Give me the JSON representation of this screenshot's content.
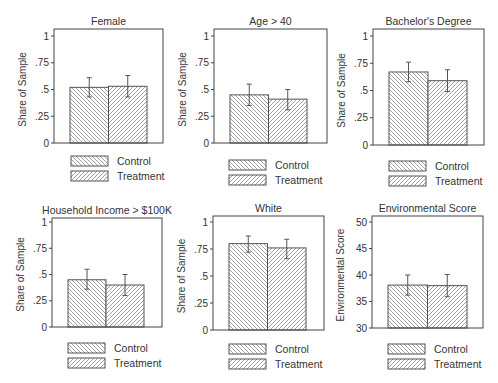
{
  "figure": {
    "legend": {
      "items": [
        {
          "label": "Control",
          "pattern": "hatch-back"
        },
        {
          "label": "Treatment",
          "pattern": "hatch-forward"
        }
      ]
    },
    "colors": {
      "frame": "#444444",
      "bar_fill": "#ffffff",
      "hatch": "#8a8a8a",
      "bar_edge": "#555555",
      "error_bar": "#555555",
      "text": "#333333"
    }
  },
  "chart_data": [
    {
      "type": "bar",
      "title": "Female",
      "xlabel": "",
      "ylabel": "Share of Sample",
      "ylim": [
        0,
        1
      ],
      "yticks": [
        "0",
        ".25",
        ".5",
        ".75",
        "1"
      ],
      "ytick_values": [
        0,
        0.25,
        0.5,
        0.75,
        1
      ],
      "categories": [
        "Control",
        "Treatment"
      ],
      "values": [
        0.52,
        0.53
      ],
      "error_low": [
        0.43,
        0.43
      ],
      "error_high": [
        0.61,
        0.63
      ],
      "grid": false,
      "legend_position": "below"
    },
    {
      "type": "bar",
      "title": "Age > 40",
      "xlabel": "",
      "ylabel": "Share of Sample",
      "ylim": [
        0,
        1
      ],
      "yticks": [
        "0",
        ".25",
        ".5",
        ".75",
        "1"
      ],
      "ytick_values": [
        0,
        0.25,
        0.5,
        0.75,
        1
      ],
      "categories": [
        "Control",
        "Treatment"
      ],
      "values": [
        0.45,
        0.41
      ],
      "error_low": [
        0.35,
        0.31
      ],
      "error_high": [
        0.55,
        0.5
      ],
      "grid": false,
      "legend_position": "below"
    },
    {
      "type": "bar",
      "title": "Bachelor's Degree",
      "xlabel": "",
      "ylabel": "Share of Sample",
      "ylim": [
        0,
        1
      ],
      "yticks": [
        "0",
        ".25",
        ".5",
        ".75",
        "1"
      ],
      "ytick_values": [
        0,
        0.25,
        0.5,
        0.75,
        1
      ],
      "categories": [
        "Control",
        "Treatment"
      ],
      "values": [
        0.67,
        0.59
      ],
      "error_low": [
        0.58,
        0.49
      ],
      "error_high": [
        0.76,
        0.69
      ],
      "grid": false,
      "legend_position": "below"
    },
    {
      "type": "bar",
      "title": "Household Income > $100K",
      "xlabel": "",
      "ylabel": "Share of Sample",
      "ylim": [
        0,
        1
      ],
      "yticks": [
        "0",
        ".25",
        ".5",
        ".75",
        "1"
      ],
      "ytick_values": [
        0,
        0.25,
        0.5,
        0.75,
        1
      ],
      "categories": [
        "Control",
        "Treatment"
      ],
      "values": [
        0.45,
        0.4
      ],
      "error_low": [
        0.36,
        0.3
      ],
      "error_high": [
        0.55,
        0.5
      ],
      "grid": false,
      "legend_position": "below"
    },
    {
      "type": "bar",
      "title": "White",
      "xlabel": "",
      "ylabel": "Share of Sample",
      "ylim": [
        0,
        1
      ],
      "yticks": [
        "0",
        ".25",
        ".5",
        ".75",
        "1"
      ],
      "ytick_values": [
        0,
        0.25,
        0.5,
        0.75,
        1
      ],
      "categories": [
        "Control",
        "Treatment"
      ],
      "values": [
        0.8,
        0.76
      ],
      "error_low": [
        0.72,
        0.66
      ],
      "error_high": [
        0.87,
        0.84
      ],
      "grid": false,
      "legend_position": "below"
    },
    {
      "type": "bar",
      "title": "Environmental Score",
      "xlabel": "",
      "ylabel": "Environmental Score",
      "ylim": [
        30,
        50
      ],
      "yticks": [
        "30",
        "35",
        "40",
        "45",
        "50"
      ],
      "ytick_values": [
        30,
        35,
        40,
        45,
        50
      ],
      "categories": [
        "Control",
        "Treatment"
      ],
      "values": [
        38.1,
        38.0
      ],
      "error_low": [
        36.2,
        35.9
      ],
      "error_high": [
        40.0,
        40.1
      ],
      "grid": false,
      "legend_position": "below"
    }
  ]
}
